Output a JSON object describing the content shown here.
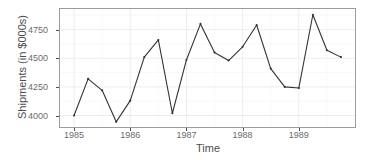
{
  "chart_data": {
    "type": "line",
    "title": "",
    "xlabel": "Time",
    "ylabel": "Shipments (in $000s)",
    "grid": true,
    "legend": false,
    "xlim": [
      1984.75,
      1990.0
    ],
    "ylim": [
      3900,
      4930
    ],
    "x_tick_labels": [
      "1985",
      "1986",
      "1987",
      "1988",
      "1989"
    ],
    "x_tick_values": [
      1985,
      1986,
      1987,
      1988,
      1989
    ],
    "y_tick_labels": [
      "4000",
      "4250",
      "4500",
      "4750"
    ],
    "y_tick_values": [
      4000,
      4250,
      4500,
      4750
    ],
    "series": [
      {
        "name": "Shipments",
        "x": [
          1985.0,
          1985.25,
          1985.5,
          1985.75,
          1986.0,
          1986.25,
          1986.5,
          1986.75,
          1987.0,
          1987.25,
          1987.5,
          1987.75,
          1988.0,
          1988.25,
          1988.5,
          1988.75,
          1989.0,
          1989.25,
          1989.5,
          1989.75
        ],
        "values": [
          4000,
          4320,
          4220,
          3945,
          4130,
          4510,
          4660,
          4020,
          4485,
          4800,
          4550,
          4480,
          4600,
          4790,
          4410,
          4250,
          4240,
          4880,
          4570,
          4510
        ]
      }
    ],
    "colors": {
      "line": "#333333",
      "panel_border": "#9c9c9c",
      "grid_major": "#ededed",
      "grid_minor": "#f6f6f6",
      "axis_text": "#6b6b6b",
      "title_text": "#4d4d4d",
      "background": "#ffffff"
    }
  }
}
